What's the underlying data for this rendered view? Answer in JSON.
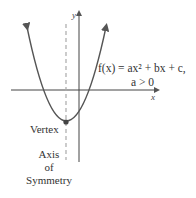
{
  "diagram": {
    "axes": {
      "x_label": "x",
      "y_label": "y"
    },
    "equation": {
      "line1": "f(x) = ax² + bx + c,",
      "line2": "a > 0"
    },
    "labels": {
      "vertex": "Vertex",
      "axis_of_symmetry": [
        "Axis",
        "of",
        "Symmetry"
      ]
    },
    "colors": {
      "curve": "#555555",
      "axes": "#444444",
      "symmetry_line": "#aaaaaa",
      "text": "#333333"
    }
  }
}
